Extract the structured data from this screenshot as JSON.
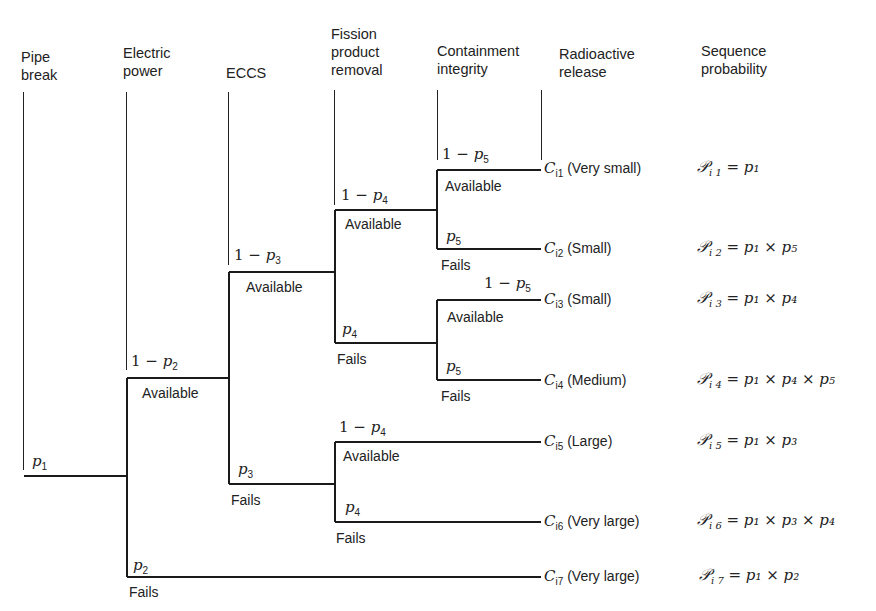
{
  "headers": [
    {
      "id": "pipe-break",
      "label": "Pipe\nbreak"
    },
    {
      "id": "electric-power",
      "label": "Electric\npower"
    },
    {
      "id": "eccs",
      "label": "ECCS"
    },
    {
      "id": "fission-product-removal",
      "label": "Fission\nproduct\nremoval"
    },
    {
      "id": "containment-integrity",
      "label": "Containment\nintegrity"
    },
    {
      "id": "radioactive-release",
      "label": "Radioactive\nrelease"
    },
    {
      "id": "sequence-probability",
      "label": "Sequence\nprobability"
    }
  ],
  "states": {
    "available": "Available",
    "fails": "Fails"
  },
  "branch_probs": {
    "p1": {
      "base": "p",
      "sub": "1",
      "prefix": ""
    },
    "one_minus_p2": {
      "base": "p",
      "sub": "2",
      "prefix": "1 − "
    },
    "p2": {
      "base": "p",
      "sub": "2",
      "prefix": ""
    },
    "one_minus_p3": {
      "base": "p",
      "sub": "3",
      "prefix": "1 − "
    },
    "p3": {
      "base": "p",
      "sub": "3",
      "prefix": ""
    },
    "one_minus_p4": {
      "base": "p",
      "sub": "4",
      "prefix": "1 − "
    },
    "p4": {
      "base": "p",
      "sub": "4",
      "prefix": ""
    },
    "one_minus_p5": {
      "base": "p",
      "sub": "5",
      "prefix": "1 − "
    },
    "p5": {
      "base": "p",
      "sub": "5",
      "prefix": ""
    }
  },
  "outcomes": [
    {
      "c": "C",
      "sub": "i1",
      "label": "(Very small)",
      "seq_sub": "i 1",
      "seq_expr": "= p₁"
    },
    {
      "c": "C",
      "sub": "i2",
      "label": "(Small)",
      "seq_sub": "i 2",
      "seq_expr": "= p₁ × p₅"
    },
    {
      "c": "C",
      "sub": "i3",
      "label": "(Small)",
      "seq_sub": "i 3",
      "seq_expr": "= p₁ × p₄"
    },
    {
      "c": "C",
      "sub": "i4",
      "label": "(Medium)",
      "seq_sub": "i 4",
      "seq_expr": "= p₁ × p₄ × p₅"
    },
    {
      "c": "C",
      "sub": "i5",
      "label": "(Large)",
      "seq_sub": "i 5",
      "seq_expr": "= p₁ × p₃"
    },
    {
      "c": "C",
      "sub": "i6",
      "label": "(Very large)",
      "seq_sub": "i 6",
      "seq_expr": "= p₁ × p₃ × p₄"
    },
    {
      "c": "C",
      "sub": "i7",
      "label": "(Very large)",
      "seq_sub": "i 7",
      "seq_expr": "= p₁ × p₂"
    }
  ],
  "sequence_symbol": "𝒫",
  "colors": {
    "line": "#1a1a1a",
    "text": "#222222",
    "background": "#ffffff"
  }
}
